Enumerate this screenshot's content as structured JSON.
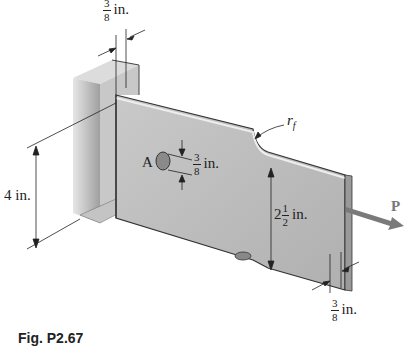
{
  "figure": {
    "caption": "Fig. P2.67",
    "labels": {
      "top_thickness": {
        "numerator": "3",
        "denominator": "8",
        "unit": "in."
      },
      "height_left": "4 in.",
      "hole_label": "A",
      "hole_diameter": {
        "numerator": "3",
        "denominator": "8",
        "unit": "in."
      },
      "fillet_radius": "r_f",
      "fillet_radius_base": "r",
      "fillet_radius_sub": "f",
      "narrow_width": {
        "whole": "2",
        "numerator": "1",
        "denominator": "2",
        "unit": "in."
      },
      "bottom_thickness": {
        "numerator": "3",
        "denominator": "8",
        "unit": "in."
      },
      "load": "P"
    },
    "colors": {
      "plate_face": "#bdbdbd",
      "plate_light": "#d9d9d9",
      "support_face": "#c8c8c8",
      "support_dark": "#9e9e9e",
      "edge": "#333333",
      "arrow": "#7a7a7a"
    }
  }
}
